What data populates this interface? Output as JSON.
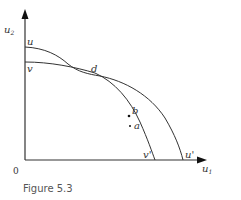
{
  "figure": {
    "caption": "Figure 5.3",
    "origin_label": "0",
    "axes": {
      "x_label": "u",
      "x_sub": "1",
      "y_label": "u",
      "y_sub": "2"
    },
    "curves": [
      {
        "name": "utility-possibility-frontier-u",
        "start_label": "u",
        "end_label": "u'"
      },
      {
        "name": "utility-possibility-frontier-v",
        "start_label": "v",
        "end_label": "v'"
      }
    ],
    "points": [
      {
        "label": "d",
        "description": "intersection of curves"
      },
      {
        "label": "b",
        "description": "point on v curve"
      },
      {
        "label": "a",
        "description": "interior point"
      }
    ],
    "colors": {
      "line": "#333333",
      "text": "#333333",
      "caption": "#555555"
    }
  }
}
